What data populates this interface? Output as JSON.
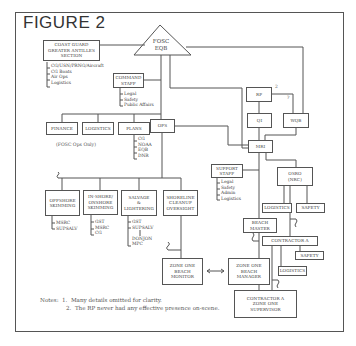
{
  "figure": {
    "title": "FIGURE 2"
  },
  "nodes": {
    "fosc": "FOSC\nEQB",
    "coast_guard": "COAST GUARD\nGREATER ANTILLES\nSECTION",
    "command_staff": "COMMAND\nSTAFF",
    "finance": "FINANCE",
    "logistics": "LOGISTICS",
    "plans": "PLANS",
    "ops": "OPS",
    "rp": "RP",
    "qi": "QI",
    "wqb": "WQB",
    "mri": "MRI",
    "support_staff": "SUPPORT\nSTAFF",
    "osro": "OSRO\n(NRC)",
    "osro_logistics": "LOGISTICS",
    "osro_safety": "SAFETY",
    "beach_master": "BEACH\nMASTER",
    "contractor_a": "CONTRACTOR A",
    "contractor_safety": "SAFETY",
    "contractor_logistics": "LOGISTICS",
    "offshore": "OFFSHORE\nSKIMMING",
    "inshore": "IN-SHORE/\nONSHORE\nSKIMMING",
    "salvage": "SALVAGE\n&\nLIGHTERING",
    "shoreline": "SHORELINE\nCLEANUP\nOVERSIGHT",
    "zone_monitor": "ZONE ONE\nBEACH\nMONITOR",
    "zone_manager": "ZONE ONE\nBEACH\nMANAGER",
    "zone_supervisor": "CONTRACTOR A\nZONE ONE\nSUPERVISOR"
  },
  "lists": {
    "coast_guard": "CG/USN/PRNG/Aircraft\nCG Boats\nAir Ops\nLogistics",
    "command_staff": "Legal\nSafety\nPublic Affairs",
    "plans": "CG\nNOAA\nEQB\nDNR",
    "support_staff": "Legal\nSafety\nAdmin\nLogistics",
    "offshore": "MSRC\nSUPSALV",
    "inshore": "GST\nMSRC\nCG",
    "salvage": "GST\nSUPSALV\n\nDONJON\nMPC"
  },
  "annotations": {
    "fosc_ops_only": "(FOSC Ops Only)",
    "rp_note_num": "2",
    "wqb_note_num": "?"
  },
  "notes": {
    "label": "Notes:",
    "line1": "1.  Many details omitted for clarity.",
    "line2": "2.  The RP never had any effective presence on-scene."
  }
}
